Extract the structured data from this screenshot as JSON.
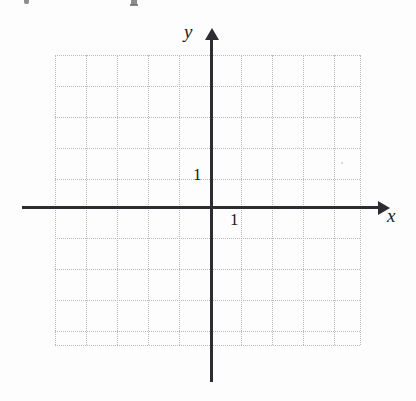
{
  "figure": {
    "width": 416,
    "height": 401,
    "background_color": "#fdfdfd"
  },
  "axes": {
    "x_axis": {
      "label": "x",
      "color": "#2c2c32",
      "has_arrowhead": true,
      "arrow_direction": "right",
      "tick_label": "1"
    },
    "y_axis": {
      "label": "y",
      "color": "#2c2c32",
      "has_arrowhead": true,
      "arrow_direction": "up",
      "tick_label": "1"
    }
  },
  "grid": {
    "style": "dotted",
    "color": "#b9b9bd",
    "spacing_px": 31,
    "columns": 10,
    "rows": 10,
    "vertical_line_offsets": [
      0,
      31,
      62,
      93,
      124,
      155,
      186,
      217,
      248,
      279,
      305
    ],
    "horizontal_line_offsets": [
      0,
      31,
      62,
      93,
      124,
      152,
      183,
      214,
      245,
      276,
      290
    ]
  },
  "chart_data": {
    "type": "scatter",
    "title": "",
    "xlabel": "x",
    "ylabel": "y",
    "x": [],
    "y": [],
    "series": [],
    "xlim": [
      -5,
      5
    ],
    "ylim": [
      -5,
      4.5
    ],
    "xticks": [
      1
    ],
    "yticks": [
      1
    ],
    "xticklabels": [
      "1"
    ],
    "yticklabels": [
      "1"
    ],
    "grid": true,
    "grid_style": "dotted",
    "legend": null,
    "annotations": []
  },
  "artifacts": {
    "top_edge_marks": "clipped descenders from the text line above the figure"
  }
}
